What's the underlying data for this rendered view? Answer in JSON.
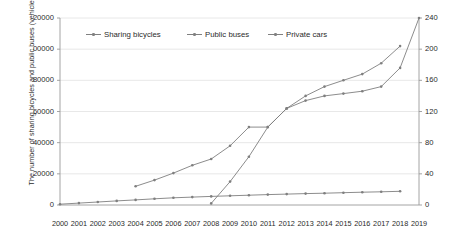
{
  "chart_data": {
    "type": "line",
    "title": "",
    "xlabel": "",
    "x": [
      "2000",
      "2001",
      "2002",
      "2003",
      "2004",
      "2005",
      "2006",
      "2007",
      "2008",
      "2009",
      "2010",
      "2011",
      "2012",
      "2013",
      "2014",
      "2015",
      "2016",
      "2017",
      "2018",
      "2019"
    ],
    "grid": true,
    "legend_position": "top-inside",
    "axes": {
      "left": {
        "label": "The number of sharing bicycles and public buses (vehicle)",
        "ticks": [
          "0",
          "20000",
          "40000",
          "60000",
          "80000",
          "100000",
          "120000"
        ],
        "ticks_rendered": [
          "0",
          "20000",
          "40000",
          "60000",
          "80000",
          "00000",
          "20000"
        ],
        "min": 0,
        "max": 120000
      },
      "right": {
        "label": "The number of private cars (10k vehicle)",
        "ticks": [
          "0",
          "40",
          "80",
          "120",
          "160",
          "200",
          "240"
        ],
        "min": 0,
        "max": 240
      }
    },
    "series": [
      {
        "name": "Sharing bicycles",
        "axis": "left",
        "color": "#7f7f7f",
        "x": [
          "2000",
          "2001",
          "2002",
          "2003",
          "2004",
          "2005",
          "2006",
          "2007",
          "2008",
          "2009",
          "2010",
          "2011",
          "2012",
          "2013",
          "2014",
          "2015",
          "2016",
          "2017",
          "2018"
        ],
        "values": [
          500,
          1200,
          1900,
          2600,
          3300,
          4000,
          4600,
          5100,
          5500,
          5900,
          6300,
          6700,
          7000,
          7300,
          7600,
          7900,
          8200,
          8500,
          8800
        ]
      },
      {
        "name": "Public buses",
        "axis": "left",
        "color": "#7f7f7f",
        "x": [
          "2004",
          "2005",
          "2006",
          "2007",
          "2008",
          "2009",
          "2010",
          "2011",
          "2012",
          "2013",
          "2014",
          "2015",
          "2016",
          "2017",
          "2018"
        ],
        "values": [
          12000,
          16000,
          20500,
          25500,
          29500,
          38000,
          50000,
          50000,
          62000,
          70000,
          76000,
          80000,
          84000,
          91000,
          102000
        ]
      },
      {
        "name": "Private cars",
        "axis": "right",
        "color": "#7f7f7f",
        "x": [
          "2008",
          "2009",
          "2010",
          "2011",
          "2012",
          "2013",
          "2014",
          "2015",
          "2016",
          "2017",
          "2018",
          "2019"
        ],
        "values": [
          2,
          30,
          62,
          100,
          124,
          134,
          140,
          143,
          146,
          152,
          176,
          240
        ]
      }
    ]
  },
  "legend": {
    "items": [
      {
        "label": "Sharing bicycles"
      },
      {
        "label": "Public buses"
      },
      {
        "label": "Private cars"
      }
    ]
  }
}
